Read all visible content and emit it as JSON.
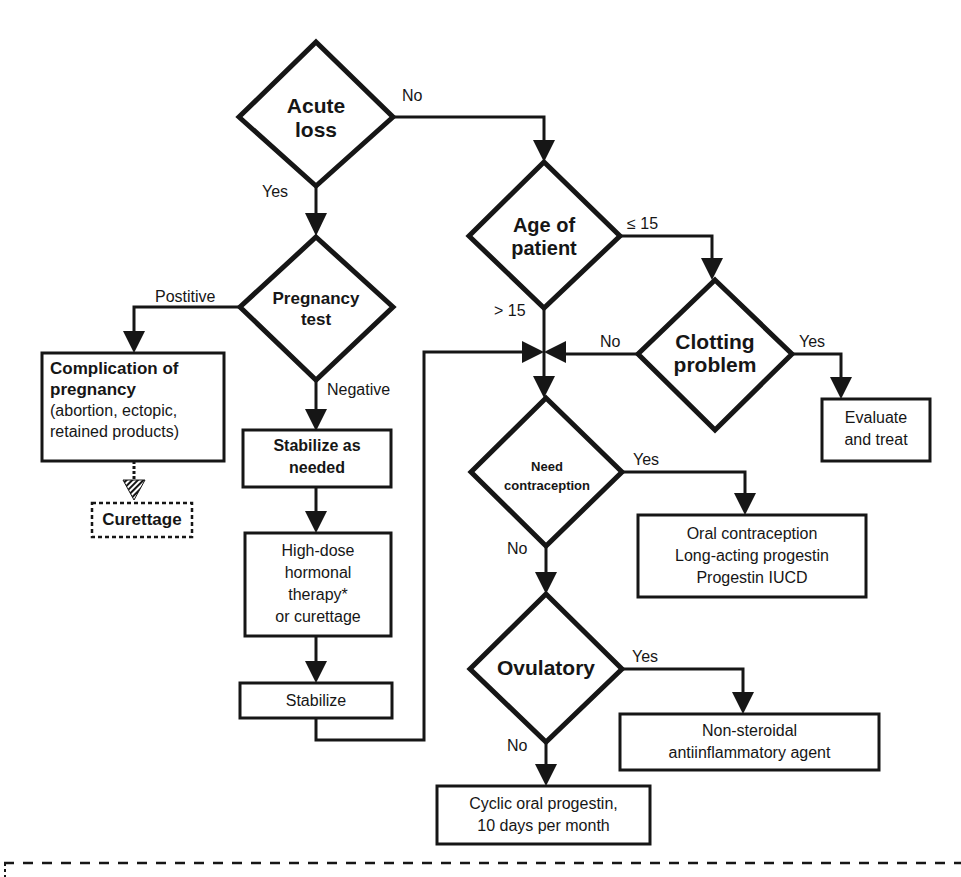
{
  "diagram": {
    "decisions": {
      "acute_loss": {
        "line1": "Acute",
        "line2": "loss"
      },
      "pregnancy_test": {
        "line1": "Pregnancy",
        "line2": "test"
      },
      "age_of_patient": {
        "line1": "Age of",
        "line2": "patient"
      },
      "clotting_problem": {
        "line1": "Clotting",
        "line2": "problem"
      },
      "need_contraception": {
        "line1": "Need",
        "line2": "contraception"
      },
      "ovulatory": {
        "line1": "Ovulatory"
      }
    },
    "edge_labels": {
      "acute_no": "No",
      "acute_yes": "Yes",
      "preg_positive": "Postitive",
      "preg_negative": "Negative",
      "age_le15": "≤ 15",
      "age_gt15": "> 15",
      "clotting_no": "No",
      "clotting_yes": "Yes",
      "contra_yes": "Yes",
      "contra_no": "No",
      "ovul_yes": "Yes",
      "ovul_no": "No"
    },
    "boxes": {
      "complication": {
        "title1": "Complication  of",
        "title2": "pregnancy",
        "detail1": "(abortion, ectopic,",
        "detail2": "retained products)"
      },
      "curettage": {
        "label": "Curettage"
      },
      "stabilize_as_needed": {
        "line1": "Stabilize  as",
        "line2": "needed"
      },
      "high_dose": {
        "line1": "High-dose",
        "line2": "hormonal",
        "line3": "therapy*",
        "line4": "or curettage"
      },
      "stabilize": {
        "label": "Stabilize"
      },
      "evaluate_treat": {
        "line1": "Evaluate",
        "line2": "and treat"
      },
      "contraception_options": {
        "line1": "Oral contraception",
        "line2": "Long-acting progestin",
        "line3": "Progestin IUCD"
      },
      "nsaid": {
        "line1": "Non-steroidal",
        "line2": "antiinflammatory agent"
      },
      "cyclic_progestin": {
        "line1": "Cyclic oral progestin,",
        "line2": "10 days per month"
      }
    },
    "colors": {
      "ink": "#161616",
      "background": "#ffffff"
    }
  }
}
